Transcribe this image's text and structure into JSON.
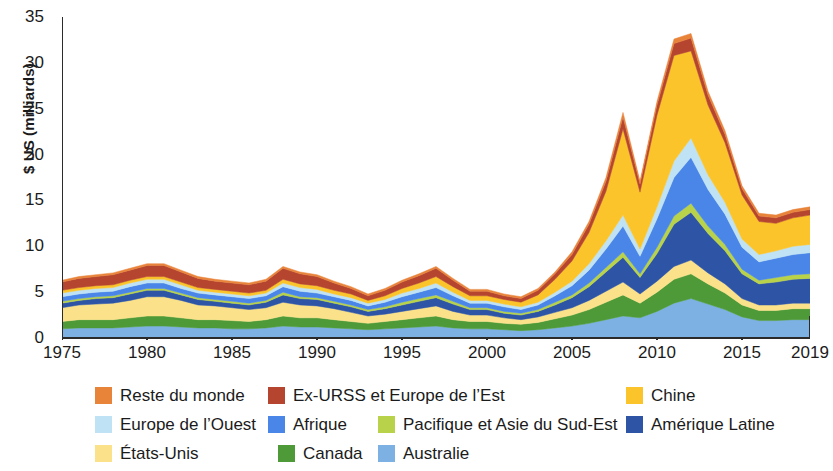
{
  "chart_data": {
    "type": "area",
    "title": "",
    "xlabel": "",
    "ylabel": "$ US (milliards)",
    "xlim": [
      1975,
      2019
    ],
    "ylim": [
      0,
      35
    ],
    "ytick_values": [
      0,
      5,
      10,
      15,
      20,
      25,
      30,
      35
    ],
    "ytick_labels": [
      "0",
      "5",
      "10",
      "15",
      "20",
      "25",
      "30",
      "35"
    ],
    "xtick_values": [
      1975,
      1980,
      1985,
      1990,
      1995,
      2000,
      2005,
      2010,
      2015,
      2019
    ],
    "xtick_labels": [
      "1975",
      "1980",
      "1985",
      "1990",
      "1995",
      "2000",
      "2005",
      "2010",
      "2015",
      "2019"
    ],
    "grid": false,
    "stacked": true,
    "legend_position": "bottom",
    "x": [
      1975,
      1976,
      1977,
      1978,
      1979,
      1980,
      1981,
      1982,
      1983,
      1984,
      1985,
      1986,
      1987,
      1988,
      1989,
      1990,
      1991,
      1992,
      1993,
      1994,
      1995,
      1996,
      1997,
      1998,
      1999,
      2000,
      2001,
      2002,
      2003,
      2004,
      2005,
      2006,
      2007,
      2008,
      2009,
      2010,
      2011,
      2012,
      2013,
      2014,
      2015,
      2016,
      2017,
      2018,
      2019
    ],
    "series": [
      {
        "name": "Australie",
        "color": "#7EB1E3",
        "values": [
          1.0,
          1.1,
          1.1,
          1.1,
          1.2,
          1.3,
          1.3,
          1.2,
          1.1,
          1.1,
          1.0,
          1.0,
          1.1,
          1.3,
          1.2,
          1.2,
          1.1,
          1.0,
          0.9,
          1.0,
          1.1,
          1.2,
          1.3,
          1.1,
          1.0,
          1.0,
          0.9,
          0.8,
          0.9,
          1.1,
          1.3,
          1.6,
          2.0,
          2.4,
          2.2,
          2.9,
          3.8,
          4.3,
          3.7,
          3.1,
          2.3,
          1.9,
          1.9,
          2.0,
          2.0
        ]
      },
      {
        "name": "Canada",
        "color": "#4E9A38",
        "values": [
          0.8,
          0.9,
          0.9,
          0.9,
          1.0,
          1.1,
          1.1,
          1.0,
          0.9,
          0.9,
          0.9,
          0.8,
          0.9,
          1.1,
          1.0,
          1.0,
          0.9,
          0.8,
          0.7,
          0.8,
          0.9,
          1.0,
          1.1,
          0.9,
          0.8,
          0.8,
          0.7,
          0.7,
          0.8,
          1.0,
          1.2,
          1.5,
          1.9,
          2.3,
          1.6,
          2.1,
          2.6,
          2.7,
          2.2,
          1.8,
          1.3,
          1.1,
          1.1,
          1.2,
          1.2
        ]
      },
      {
        "name": "États-Unis",
        "color": "#FBE28A",
        "values": [
          1.5,
          1.6,
          1.7,
          1.8,
          1.9,
          2.1,
          2.1,
          1.9,
          1.6,
          1.5,
          1.4,
          1.3,
          1.3,
          1.5,
          1.4,
          1.3,
          1.2,
          1.0,
          0.8,
          0.8,
          0.9,
          1.0,
          1.1,
          0.9,
          0.7,
          0.7,
          0.6,
          0.5,
          0.6,
          0.7,
          0.8,
          1.0,
          1.2,
          1.4,
          1.0,
          1.2,
          1.4,
          1.5,
          1.2,
          1.0,
          0.7,
          0.6,
          0.6,
          0.6,
          0.6
        ]
      },
      {
        "name": "Amérique Latine",
        "color": "#2E55A5",
        "values": [
          0.5,
          0.5,
          0.6,
          0.6,
          0.7,
          0.7,
          0.7,
          0.6,
          0.6,
          0.5,
          0.5,
          0.5,
          0.6,
          0.8,
          0.7,
          0.7,
          0.6,
          0.6,
          0.5,
          0.6,
          0.7,
          0.8,
          0.9,
          0.8,
          0.6,
          0.6,
          0.5,
          0.5,
          0.6,
          0.8,
          1.1,
          1.5,
          2.1,
          2.7,
          1.8,
          3.0,
          4.6,
          5.2,
          4.3,
          3.6,
          2.7,
          2.3,
          2.5,
          2.6,
          2.7
        ]
      },
      {
        "name": "Pacifique et Asie du Sud-Est",
        "color": "#B8D24A",
        "values": [
          0.2,
          0.2,
          0.2,
          0.2,
          0.2,
          0.2,
          0.2,
          0.2,
          0.2,
          0.2,
          0.2,
          0.2,
          0.2,
          0.3,
          0.2,
          0.2,
          0.2,
          0.2,
          0.2,
          0.2,
          0.3,
          0.3,
          0.3,
          0.3,
          0.2,
          0.2,
          0.2,
          0.2,
          0.2,
          0.3,
          0.3,
          0.4,
          0.5,
          0.6,
          0.4,
          0.7,
          0.9,
          1.0,
          0.8,
          0.7,
          0.5,
          0.4,
          0.5,
          0.5,
          0.5
        ]
      },
      {
        "name": "Afrique",
        "color": "#4A86E8",
        "values": [
          0.5,
          0.5,
          0.5,
          0.5,
          0.6,
          0.6,
          0.6,
          0.5,
          0.5,
          0.5,
          0.5,
          0.5,
          0.5,
          0.6,
          0.6,
          0.5,
          0.5,
          0.5,
          0.4,
          0.5,
          0.6,
          0.7,
          0.8,
          0.6,
          0.5,
          0.5,
          0.5,
          0.4,
          0.5,
          0.7,
          1.0,
          1.4,
          2.0,
          2.8,
          1.9,
          3.1,
          4.2,
          5.0,
          4.0,
          3.3,
          2.4,
          2.0,
          2.1,
          2.2,
          2.3
        ]
      },
      {
        "name": "Europe de l’Ouest",
        "color": "#BFE2F5",
        "values": [
          0.4,
          0.4,
          0.4,
          0.4,
          0.4,
          0.4,
          0.4,
          0.4,
          0.3,
          0.3,
          0.3,
          0.3,
          0.3,
          0.4,
          0.4,
          0.4,
          0.3,
          0.3,
          0.3,
          0.3,
          0.4,
          0.4,
          0.5,
          0.4,
          0.3,
          0.3,
          0.3,
          0.3,
          0.3,
          0.4,
          0.5,
          0.7,
          0.9,
          1.2,
          0.8,
          1.3,
          1.8,
          2.1,
          1.6,
          1.3,
          0.9,
          0.8,
          0.8,
          0.9,
          0.9
        ]
      },
      {
        "name": "Chine",
        "color": "#FBC42B",
        "values": [
          0.3,
          0.3,
          0.3,
          0.3,
          0.3,
          0.3,
          0.3,
          0.3,
          0.3,
          0.3,
          0.3,
          0.3,
          0.3,
          0.4,
          0.4,
          0.4,
          0.4,
          0.4,
          0.3,
          0.4,
          0.5,
          0.6,
          0.7,
          0.6,
          0.5,
          0.5,
          0.5,
          0.5,
          0.8,
          1.4,
          2.2,
          3.4,
          5.4,
          9.4,
          6.2,
          10.0,
          11.5,
          9.5,
          7.6,
          6.5,
          4.8,
          3.6,
          3.0,
          3.1,
          3.2
        ]
      },
      {
        "name": "Ex-URSS et Europe de l’Est",
        "color": "#B5452E",
        "values": [
          0.9,
          1.0,
          1.0,
          1.1,
          1.1,
          1.2,
          1.2,
          1.1,
          1.0,
          0.9,
          0.9,
          0.9,
          1.0,
          1.2,
          1.1,
          1.0,
          0.8,
          0.6,
          0.5,
          0.6,
          0.7,
          0.8,
          0.9,
          0.7,
          0.5,
          0.5,
          0.4,
          0.4,
          0.5,
          0.6,
          0.7,
          0.9,
          1.1,
          1.3,
          0.9,
          1.1,
          1.3,
          1.4,
          1.1,
          0.9,
          0.7,
          0.6,
          0.6,
          0.6,
          0.6
        ]
      },
      {
        "name": "Reste du monde",
        "color": "#E8833A",
        "values": [
          0.2,
          0.2,
          0.2,
          0.2,
          0.2,
          0.2,
          0.2,
          0.2,
          0.2,
          0.2,
          0.2,
          0.2,
          0.2,
          0.2,
          0.2,
          0.2,
          0.2,
          0.2,
          0.2,
          0.2,
          0.2,
          0.2,
          0.2,
          0.2,
          0.2,
          0.2,
          0.2,
          0.2,
          0.2,
          0.2,
          0.3,
          0.3,
          0.4,
          0.5,
          0.3,
          0.4,
          0.5,
          0.5,
          0.4,
          0.4,
          0.3,
          0.3,
          0.3,
          0.3,
          0.3
        ]
      }
    ]
  },
  "legend": {
    "rows": [
      [
        {
          "label": "Reste du monde",
          "color": "#E8833A",
          "left": 95
        },
        {
          "label": "Ex-URSS et Europe de l’Est",
          "color": "#B5452E",
          "left": 268
        },
        {
          "label": "Chine",
          "color": "#FBC42B",
          "left": 626
        }
      ],
      [
        {
          "label": "Europe de l’Ouest",
          "color": "#BFE2F5",
          "left": 95
        },
        {
          "label": "Afrique",
          "color": "#4A86E8",
          "left": 268
        },
        {
          "label": "Pacifique et Asie du Sud-Est",
          "color": "#B8D24A",
          "left": 378
        },
        {
          "label": "Amérique Latine",
          "color": "#2E55A5",
          "left": 626
        }
      ],
      [
        {
          "label": "États-Unis",
          "color": "#FBE28A",
          "left": 95
        },
        {
          "label": "Canada",
          "color": "#4E9A38",
          "left": 278
        },
        {
          "label": "Australie",
          "color": "#7EB1E3",
          "left": 378
        }
      ]
    ]
  },
  "axes": {
    "y_title": "$ US (milliards)"
  }
}
